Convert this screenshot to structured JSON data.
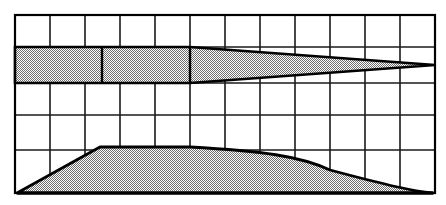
{
  "figure": {
    "type": "technical-line-drawing",
    "width": 446,
    "height": 205,
    "background_color": "#ffffff",
    "line_color": "#000000",
    "grid_line_color": "#1a1a1a",
    "fill_pattern": "50-percent-checkerboard-dither",
    "fill_color": "#a8a8a8"
  },
  "grid": {
    "label": "reference-grid",
    "columns": 12,
    "rows": 5,
    "x_left": 15,
    "x_right": 435,
    "y_top": 15,
    "y_bottom": 193,
    "cell_width": 35,
    "vertical_lines": [
      15,
      50,
      85,
      120,
      155,
      190,
      225,
      260,
      295,
      330,
      365,
      400,
      435
    ],
    "horizontal_lines": [
      15,
      47,
      83,
      115,
      150,
      193
    ],
    "outer_border_width": 2.2,
    "inner_line_width": 1.6
  },
  "planform": {
    "label": "wing-planform-top-view",
    "description": "Half-span wing planform: constant-chord inboard section then tapering outboard panel converging to a pointed tip",
    "root_leading_edge_y": 47,
    "root_trailing_edge_y": 83,
    "root_chord": 36,
    "constant_chord_end_x": 190,
    "inboard_rib_x": 102,
    "tip_x": 435,
    "tip_y": 65,
    "outline_points": [
      [
        15,
        47
      ],
      [
        190,
        47
      ],
      [
        435,
        65
      ],
      [
        190,
        83
      ],
      [
        15,
        83
      ]
    ],
    "internal_lines": [
      {
        "name": "inboard-rib-line",
        "x1": 102,
        "y1": 47,
        "x2": 102,
        "y2": 83
      },
      {
        "name": "taper-break-line",
        "x1": 190,
        "y1": 47,
        "x2": 190,
        "y2": 83
      }
    ],
    "stroke_width": 2.6
  },
  "profile": {
    "label": "airfoil-profile-side-view",
    "description": "Side elevation: straight ramp from a sharp leading point up to a flat plateau, then a smooth S-curve trailing surface down to the baseline",
    "baseline_y": 193,
    "leading_point": [
      17,
      193
    ],
    "ramp_top": [
      100,
      147
    ],
    "plateau_start_x": 100,
    "plateau_end_x": 190,
    "plateau_y": 147,
    "trailing_point": [
      433,
      193
    ],
    "curve_control_points": [
      [
        190,
        147
      ],
      [
        262,
        152
      ],
      [
        330,
        170
      ],
      [
        390,
        186
      ],
      [
        433,
        193
      ]
    ],
    "stroke_width": 2.8
  },
  "annotations": {
    "has_text_labels": false,
    "has_dimensions": false,
    "has_axis_ticks": false
  }
}
